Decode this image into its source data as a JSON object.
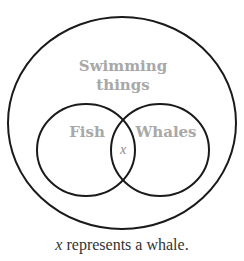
{
  "diagram": {
    "type": "venn",
    "outer_set": {
      "label_line1": "Swimming",
      "label_line2": "things"
    },
    "inner_sets": [
      {
        "label": "Fish"
      },
      {
        "label": "Whales"
      }
    ],
    "element": {
      "label": "x",
      "region": "Fish ∩ Whales"
    },
    "caption_var": "x",
    "caption_text": " represents a whale.",
    "colors": {
      "stroke": "#1a1a1a",
      "label": "#a8a8a8",
      "text": "#333333"
    }
  }
}
